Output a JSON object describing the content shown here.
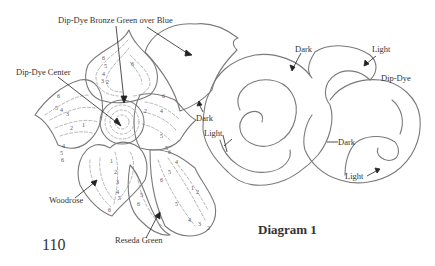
{
  "page_number": "110",
  "diagram_title": "Diagram 1",
  "labels": {
    "bronze": "Dip-Dye Bronze Green over Blue",
    "center": "Dip-Dye Center",
    "woodrose": "Woodrose",
    "reseda": "Reseda Green",
    "dark1": "Dark",
    "light1": "Light",
    "dark2": "Dark",
    "light2": "Light",
    "dipdye": "Dip-Dye",
    "dark3": "Dark",
    "light3": "Light"
  },
  "colors": {
    "outline": "#7a7a7a",
    "dash": "#9a9a9a",
    "arrow": "#222222",
    "text": "#333333"
  }
}
